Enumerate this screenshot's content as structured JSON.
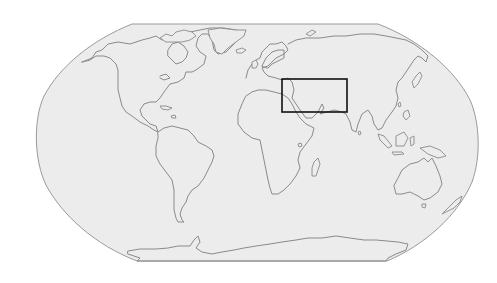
{
  "map": {
    "projection": "Robinson",
    "style": "outline",
    "colors": {
      "ocean_fill": "#ececec",
      "coastline": "#8a8a8a",
      "frame_border": "#9a9a9a",
      "highlight_box": "#111111",
      "background": "#ffffff"
    },
    "highlight_region": {
      "label": "Middle East",
      "bounds_px": {
        "x": 282,
        "y": 79,
        "width": 65,
        "height": 33
      }
    },
    "landmasses": [
      "North America",
      "South America",
      "Europe",
      "Africa",
      "Asia",
      "Australia",
      "Antarctica"
    ]
  }
}
